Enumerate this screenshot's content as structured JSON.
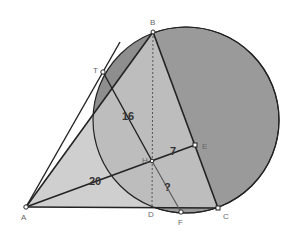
{
  "diagram": {
    "colors": {
      "background": "#ffffff",
      "circle_fill": "#9a9a9a",
      "triangle_fill": "#cfcfcf",
      "lens_fill": "#8e8e8e",
      "line": "#222222",
      "altitude": "#555555",
      "label": "#666666",
      "number": "#333333"
    },
    "points": {
      "A": {
        "label": "A",
        "x": 26,
        "y": 207
      },
      "B": {
        "label": "B",
        "x": 153,
        "y": 32
      },
      "C": {
        "label": "C",
        "x": 218,
        "y": 208
      },
      "D": {
        "label": "D",
        "x": 152,
        "y": 207
      },
      "E": {
        "label": "E",
        "x": 195,
        "y": 145
      },
      "F": {
        "label": "F",
        "x": 181,
        "y": 212
      },
      "H": {
        "label": "H",
        "x": 152,
        "y": 161
      },
      "T": {
        "label": "T",
        "x": 103,
        "y": 72
      }
    },
    "circle": {
      "cx": 186,
      "cy": 120,
      "r": 93
    },
    "measurements": {
      "TH": "16",
      "AH": "20",
      "HE": "7",
      "HF": "?"
    }
  }
}
